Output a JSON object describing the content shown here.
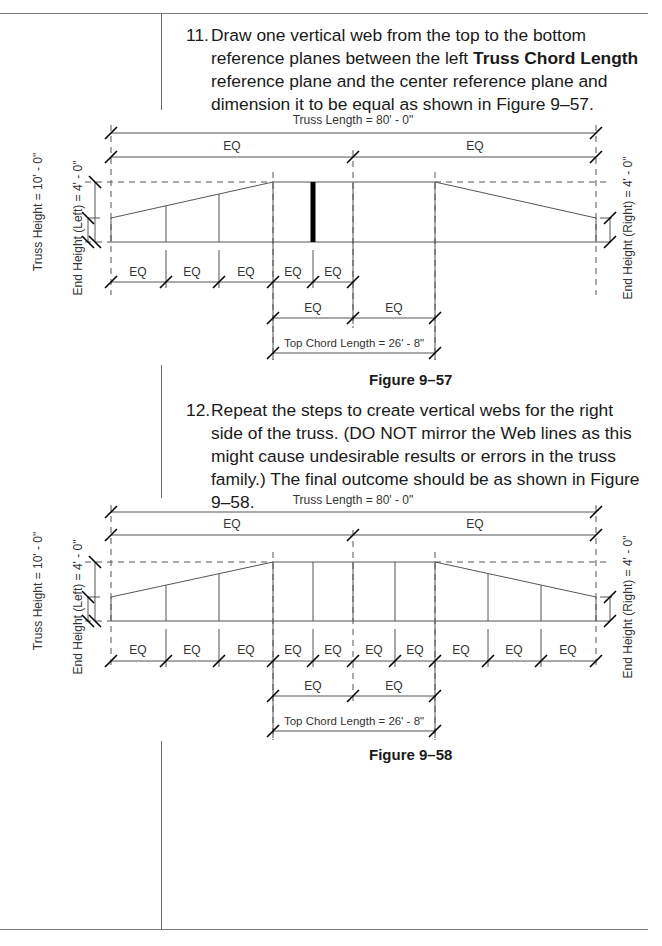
{
  "steps": [
    {
      "number": "11.",
      "text_before": "Draw one vertical web from the top to the bottom reference planes between the left ",
      "bold": "Truss Chord Length",
      "text_after": " reference plane and the center reference plane and dimension it to be equal as shown in Figure 9–57."
    },
    {
      "number": "12.",
      "text": "Repeat the steps to create vertical webs for the right side of the truss. (DO NOT mirror the Web lines as this might cause undesirable results or errors in the truss family.) The final outcome should be as shown in Figure 9–58."
    }
  ],
  "figures": [
    {
      "caption": "Figure 9–57",
      "truss_length_label": "Truss Length = 80' - 0\"",
      "truss_height_label": "Truss Height = 10' - 0\"",
      "end_height_left_label": "End Height (Left) = 4' - 0\"",
      "end_height_right_label": "End Height (Right) = 4' - 0\"",
      "top_chord_length_label": "Top Chord Length = 26' - 8\"",
      "eq_label": "EQ",
      "upper_eq_count": 2,
      "web_row_eq_count": 5,
      "top_chord_eq_count": 2,
      "highlighted_web": "left-center web (bold)"
    },
    {
      "caption": "Figure 9–58",
      "truss_length_label": "Truss Length = 80' - 0\"",
      "truss_height_label": "Truss Height = 10' - 0\"",
      "end_height_left_label": "End Height (Left) = 4' - 0\"",
      "end_height_right_label": "End Height (Right) = 4' - 0\"",
      "top_chord_length_label": "Top Chord Length = 26' - 8\"",
      "eq_label": "EQ",
      "upper_eq_count": 2,
      "web_row_eq_count": 10,
      "top_chord_eq_count": 2
    }
  ]
}
